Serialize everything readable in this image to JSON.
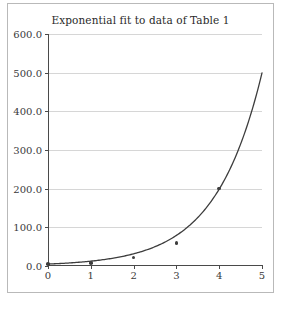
{
  "chart_data": {
    "type": "line",
    "title": "Exponential fit to data of Table 1",
    "xlabel": "",
    "ylabel": "",
    "xlim": [
      0,
      5
    ],
    "ylim": [
      0,
      600
    ],
    "grid": true,
    "legend": null,
    "xticks": [
      "0",
      "1",
      "2",
      "3",
      "4",
      "5"
    ],
    "xtick_values": [
      0,
      1,
      2,
      3,
      4,
      5
    ],
    "yticks": [
      "0.0",
      "100.0",
      "200.0",
      "300.0",
      "400.0",
      "500.0",
      "600.0"
    ],
    "ytick_values": [
      0,
      100,
      200,
      300,
      400,
      500,
      600
    ],
    "series": [
      {
        "name": "exponential fit",
        "type": "line",
        "color": "#3d3d3d",
        "model": "y = 5.0 * exp(0.92 * x)",
        "x": [
          0,
          0.5,
          1,
          1.5,
          2,
          2.5,
          3,
          3.5,
          4,
          4.5,
          5
        ],
        "values": [
          5,
          7.9,
          12.5,
          19.9,
          31.5,
          49.9,
          79.1,
          125.4,
          198.8,
          315.2,
          499.6
        ]
      },
      {
        "name": "data of Table 1",
        "type": "scatter",
        "color": "#3d3d3d",
        "x": [
          0,
          1,
          2,
          3,
          4
        ],
        "values": [
          5,
          8,
          22,
          60,
          200
        ]
      }
    ]
  },
  "figure": {
    "border_color": "#b9b9b9",
    "background": "#ffffff",
    "grid_color": "#d6d6d6",
    "axis_color": "#4a4a4a",
    "curve_color": "#3d3d3d",
    "marker_color": "#3d3d3d"
  }
}
